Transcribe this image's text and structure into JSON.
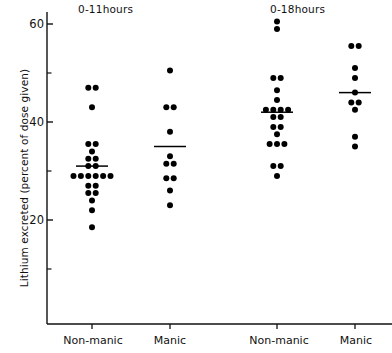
{
  "figure": {
    "ylabel": "Lithium excreted (percent of dose given)",
    "panel_titles": [
      "0-11hours",
      "0-18hours"
    ],
    "axis_color": "#111111",
    "point_color": "#000000",
    "background": "#ffffff"
  },
  "axis": {
    "y_ticks_major": [
      20,
      40,
      60
    ],
    "y_tick_labels": [
      "20",
      "40",
      "60"
    ],
    "y_ticks_minor": [
      10,
      30,
      50
    ],
    "y_min": 0,
    "y_max": 62
  },
  "categories": {
    "labels": [
      "Non-manic",
      "Manic",
      "Non-manic",
      "Manic"
    ]
  },
  "chart_data": {
    "type": "scatter",
    "title": "",
    "subtitle": "",
    "xlabel": "",
    "ylabel": "Lithium excreted (percent of dose given)",
    "ylim": [
      0,
      62
    ],
    "grid": false,
    "legend": "none",
    "panels": [
      {
        "name": "0-11hours",
        "groups": [
          {
            "name": "Non-manic",
            "mean": 31.0,
            "n": 23,
            "values": [
              47.0,
              46.0,
              43.0,
              35.5,
              34.5,
              34.0,
              32.5,
              32.5,
              31.0,
              31.0,
              29.0,
              29.0,
              29.0,
              28.0,
              28.0,
              28.0,
              27.0,
              27.0,
              25.5,
              25.0,
              24.0,
              22.0,
              18.5
            ]
          },
          {
            "name": "Manic",
            "mean": 35.0,
            "n": 11,
            "values": [
              50.5,
              43.0,
              43.0,
              38.0,
              33.0,
              31.5,
              30.5,
              28.5,
              27.5,
              26.0,
              23.0
            ]
          }
        ]
      },
      {
        "name": "0-18hours",
        "groups": [
          {
            "name": "Non-manic",
            "mean": 42.0,
            "n": 22,
            "values": [
              60.5,
              59.0,
              49.0,
              49.0,
              46.5,
              44.5,
              42.5,
              42.0,
              42.0,
              42.0,
              41.0,
              41.0,
              39.0,
              39.0,
              37.5,
              35.5,
              35.5,
              35.5,
              31.0,
              31.0,
              29.0
            ]
          },
          {
            "name": "Manic",
            "mean": 46.0,
            "n": 10,
            "values": [
              55.5,
              54.5,
              51.0,
              49.0,
              46.0,
              44.0,
              43.0,
              42.5,
              37.0,
              35.0
            ]
          }
        ]
      }
    ]
  }
}
